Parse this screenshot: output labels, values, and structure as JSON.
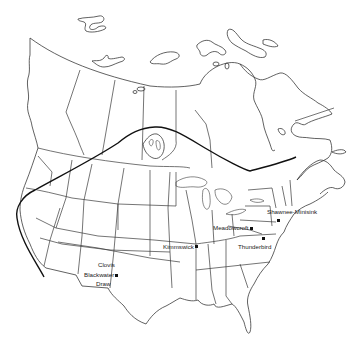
{
  "map": {
    "subject": "North America (Canada and contiguous United States)",
    "style": "black-and-white line map",
    "colors": {
      "background": "#ffffff",
      "lines": "#2e2e2e",
      "boundary": "#111111",
      "site_marker": "#111111"
    },
    "boundary_line": {
      "description": "bold curved line spanning from California coast north-east across Canada to the Gulf of St. Lawrence"
    },
    "sites": [
      {
        "id": "clovis",
        "label_lines": [
          "Clovis",
          "Blackwater",
          "Draw"
        ],
        "x": 116,
        "y": 275
      },
      {
        "id": "kimmswick",
        "label": "Kimmswick",
        "x": 195,
        "y": 246
      },
      {
        "id": "meadowcroft",
        "label": "Meadowcroft",
        "x": 251,
        "y": 228
      },
      {
        "id": "thunderbird",
        "label": "Thunderbird",
        "x": 263,
        "y": 238
      },
      {
        "id": "shawnee-minisink",
        "label": "Shawnee-Minisink",
        "x": 278,
        "y": 219
      }
    ]
  }
}
